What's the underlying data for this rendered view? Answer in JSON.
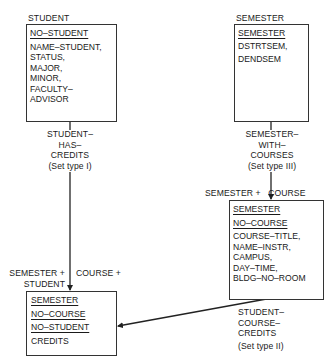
{
  "records": {
    "student": {
      "title": "STUDENT",
      "keys": [
        "NO–STUDENT"
      ],
      "fields": [
        "NAME–STUDENT,",
        "STATUS,",
        "MAJOR,",
        "MINOR,",
        "FACULTY–",
        "ADVISOR"
      ]
    },
    "semester": {
      "title": "SEMESTER",
      "keys": [
        "SEMESTER"
      ],
      "fields": [
        "DSTRTSEM,",
        "DENDSEM"
      ]
    },
    "course": {
      "keys": [
        "SEMESTER",
        "NO–COURSE"
      ],
      "fields": [
        "COURSE–TITLE,",
        "NAME–INSTR,",
        "CAMPUS,",
        "DAY–TIME,",
        "BLDG–NO–ROOM"
      ]
    },
    "credits": {
      "keys": [
        "SEMESTER",
        "NO–COURSE",
        "NO–STUDENT"
      ],
      "fields": [
        "CREDITS"
      ]
    }
  },
  "sets": {
    "student_has_credits": {
      "name_lines": [
        "STUDENT–",
        "HAS–",
        "CREDITS"
      ],
      "type": "(Set type I)"
    },
    "semester_with_courses": {
      "name_lines": [
        "SEMESTER–",
        "WITH–",
        "COURSES"
      ],
      "type": "(Set type III)"
    },
    "student_course_credits": {
      "name_lines": [
        "STUDENT–",
        "COURSE–",
        "CREDITS"
      ],
      "type": "(Set type II)"
    }
  },
  "key_labels": {
    "course_key": "SEMESTER +   COURSE",
    "credits_key_left_1": "SEMESTER +",
    "credits_key_left_2": "STUDENT",
    "credits_key_right": "COURSE +"
  }
}
